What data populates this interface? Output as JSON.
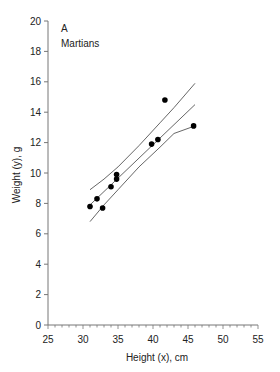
{
  "chart_data": {
    "type": "scatter",
    "panel_label": "A",
    "title": "Martians",
    "xlabel": "Height (x), cm",
    "ylabel": "Weight (y), g",
    "xlim": [
      25,
      55
    ],
    "ylim": [
      0,
      20
    ],
    "x_ticks": [
      25,
      30,
      35,
      40,
      45,
      50,
      55
    ],
    "y_ticks": [
      0,
      2,
      4,
      6,
      8,
      10,
      12,
      14,
      16,
      18,
      20
    ],
    "grid": false,
    "points": [
      {
        "x": 31.0,
        "y": 7.8
      },
      {
        "x": 32.0,
        "y": 8.3
      },
      {
        "x": 32.8,
        "y": 7.7
      },
      {
        "x": 34.0,
        "y": 9.1
      },
      {
        "x": 34.8,
        "y": 9.6
      },
      {
        "x": 34.8,
        "y": 9.9
      },
      {
        "x": 39.8,
        "y": 11.9
      },
      {
        "x": 40.7,
        "y": 12.2
      },
      {
        "x": 41.7,
        "y": 14.8
      },
      {
        "x": 45.8,
        "y": 13.1
      }
    ],
    "regression_line": {
      "x": [
        31,
        46
      ],
      "y": [
        7.9,
        14.5
      ]
    },
    "confidence_band_upper": {
      "x": [
        31,
        33,
        35,
        38,
        41,
        43,
        46
      ],
      "y": [
        8.9,
        9.6,
        10.4,
        11.8,
        13.3,
        14.3,
        15.9
      ]
    },
    "confidence_band_lower": {
      "x": [
        31,
        33,
        35,
        38,
        41,
        43,
        46
      ],
      "y": [
        6.8,
        7.9,
        8.9,
        10.4,
        11.7,
        12.6,
        13.1
      ]
    }
  }
}
